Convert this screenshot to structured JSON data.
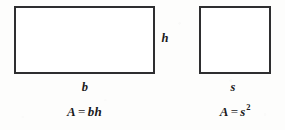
{
  "figure": {
    "background_color": "#fdfdfc",
    "ink_color": "#2e2e30",
    "text_color": "#19191b"
  },
  "rectangle": {
    "shape_name": "rectangle",
    "base_label": "b",
    "height_label": "h",
    "formula": {
      "area_symbol": "A",
      "equals": "=",
      "expression": "bh",
      "full_text": "A = bh"
    }
  },
  "square": {
    "shape_name": "square",
    "side_label": "s",
    "formula": {
      "area_symbol": "A",
      "equals": "=",
      "base": "s",
      "exponent": "2",
      "full_text": "A = s2"
    }
  }
}
